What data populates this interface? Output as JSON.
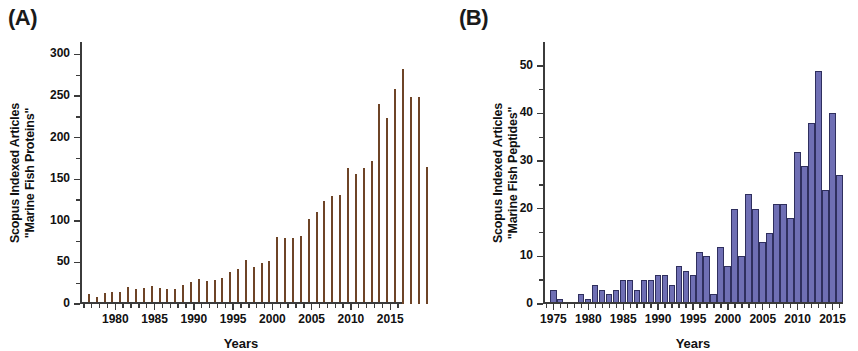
{
  "figure": {
    "panels": [
      {
        "letter": "(A)",
        "ylabel_line1": "Scopus Indexed Articles",
        "ylabel_line2": "\"Marine Fish Proteins\"",
        "xlabel": "Years",
        "bar_color": "#e8763c",
        "bar_edge_color": "#6e4427"
      },
      {
        "letter": "(B)",
        "ylabel_line1": "Scopus Indexed Articles",
        "ylabel_line2": "\"Marine Fish Peptides\"",
        "xlabel": "Years",
        "bar_color": "#6f6fb4",
        "bar_edge_color": "#2f2f5e"
      }
    ]
  },
  "chart_data": [
    {
      "type": "bar",
      "panel": "A",
      "title": "",
      "xlabel": "Years",
      "ylabel": "Scopus Indexed Articles \"Marine Fish Proteins\"",
      "xlim": [
        1976,
        2017
      ],
      "ylim": [
        0,
        315
      ],
      "yticks": [
        0,
        50,
        100,
        150,
        200,
        250,
        300
      ],
      "ytick_labels": [
        "0",
        "50",
        "100",
        "150",
        "200",
        "250",
        "300"
      ],
      "xticks": [
        1980,
        1985,
        1990,
        1995,
        2000,
        2005,
        2010,
        2015
      ],
      "xtick_labels": [
        "1980",
        "1985",
        "1990",
        "1995",
        "2000",
        "2005",
        "2010",
        "2015"
      ],
      "grid": false,
      "legend": null,
      "categories": [
        1977,
        1978,
        1979,
        1980,
        1981,
        1982,
        1983,
        1984,
        1985,
        1986,
        1987,
        1988,
        1989,
        1990,
        1991,
        1992,
        1993,
        1994,
        1995,
        1996,
        1997,
        1998,
        1999,
        2000,
        2001,
        2002,
        2003,
        2004,
        2005,
        2006,
        2007,
        2008,
        2009,
        2010,
        2011,
        2012,
        2013,
        2014,
        2015,
        2016
      ],
      "values": [
        12,
        8,
        13,
        14,
        15,
        20,
        18,
        19,
        22,
        19,
        18,
        18,
        23,
        26,
        30,
        28,
        29,
        31,
        38,
        42,
        53,
        45,
        49,
        52,
        80,
        79,
        79,
        82,
        102,
        111,
        124,
        130,
        131,
        163,
        156,
        164,
        172,
        241,
        224,
        259,
        283,
        249,
        249,
        165
      ]
    },
    {
      "type": "bar",
      "panel": "B",
      "title": "",
      "xlabel": "Years",
      "ylabel": "Scopus Indexed Articles \"Marine Fish Peptides\"",
      "xlim": [
        1974,
        2017
      ],
      "ylim": [
        0,
        55
      ],
      "yticks": [
        0,
        10,
        20,
        30,
        40,
        50
      ],
      "ytick_labels": [
        "0",
        "10",
        "20",
        "30",
        "40",
        "50"
      ],
      "xticks": [
        1975,
        1980,
        1985,
        1990,
        1995,
        2000,
        2005,
        2010,
        2015
      ],
      "xtick_labels": [
        "1975",
        "1980",
        "1985",
        "1990",
        "1995",
        "2000",
        "2005",
        "2010",
        "2015"
      ],
      "grid": false,
      "legend": null,
      "categories": [
        1975,
        1976,
        1977,
        1978,
        1979,
        1980,
        1981,
        1982,
        1983,
        1984,
        1985,
        1986,
        1987,
        1988,
        1989,
        1990,
        1991,
        1992,
        1993,
        1994,
        1995,
        1996,
        1997,
        1998,
        1999,
        2000,
        2001,
        2002,
        2003,
        2004,
        2005,
        2006,
        2007,
        2008,
        2009,
        2010,
        2011,
        2012,
        2013,
        2014,
        2015,
        2016
      ],
      "values": [
        3,
        1,
        0,
        0,
        2,
        1,
        4,
        3,
        2,
        3,
        5,
        5,
        3,
        5,
        5,
        6,
        6,
        4,
        8,
        7,
        6,
        11,
        10,
        2,
        12,
        8,
        20,
        10,
        23,
        20,
        13,
        15,
        21,
        21,
        18,
        32,
        29,
        38,
        49,
        24,
        40,
        27
      ]
    }
  ]
}
